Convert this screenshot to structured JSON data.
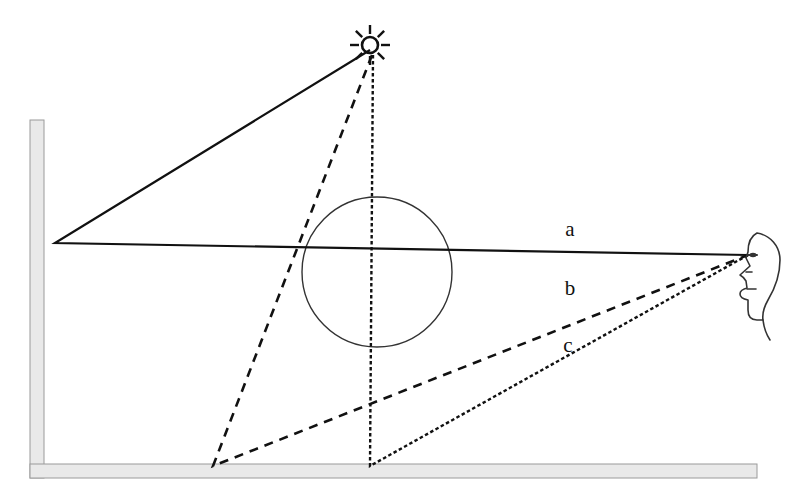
{
  "figure": {
    "background_color": "#ffffff",
    "width": 807,
    "height": 503
  },
  "colors": {
    "ink": "#1a1a1a",
    "line": "#111111",
    "surface_fill": "#e9e9e9",
    "surface_stroke": "#9a9a9a",
    "sphere_stroke": "#333333",
    "background": "#ffffff"
  },
  "labels": {
    "ray_a": "a",
    "ray_b": "b",
    "ray_c": "c"
  },
  "label_positions": {
    "ray_a": {
      "x": 570,
      "y": 236
    },
    "ray_b": {
      "x": 570,
      "y": 295
    },
    "ray_c": {
      "x": 568,
      "y": 352
    }
  },
  "objects": {
    "light_source": {
      "name": "sun",
      "icon": "sun-icon",
      "center": {
        "x": 370,
        "y": 45
      },
      "core_radius": 8,
      "ray_count": 8,
      "ray_inner": 11,
      "ray_outer": 20
    },
    "observer": {
      "name": "head-profile",
      "icon": "head-profile-icon",
      "eye_point": {
        "x": 748,
        "y": 255
      },
      "facing": "left"
    },
    "sphere": {
      "name": "transparent-sphere",
      "center": {
        "x": 377,
        "y": 272
      },
      "radius": 75,
      "filled": false
    },
    "wall": {
      "name": "vertical-wall",
      "x": 30,
      "y": 120,
      "width": 14,
      "height": 358
    },
    "floor": {
      "name": "horizontal-floor",
      "x": 30,
      "y": 464,
      "width": 727,
      "height": 14
    }
  },
  "rays": [
    {
      "id": "a",
      "label": "a",
      "style": "solid",
      "dash": "none",
      "description": "Source reflects off the wall then travels to the eye",
      "points": [
        {
          "x": 370,
          "y": 50
        },
        {
          "x": 55,
          "y": 243
        },
        {
          "x": 748,
          "y": 255
        }
      ]
    },
    {
      "id": "b",
      "label": "b",
      "style": "dashed",
      "dash": "9 7",
      "description": "Source reflects off the floor then travels to the eye",
      "points": [
        {
          "x": 372,
          "y": 55
        },
        {
          "x": 213,
          "y": 466
        },
        {
          "x": 748,
          "y": 255
        }
      ]
    },
    {
      "id": "c",
      "label": "c",
      "style": "dotted",
      "dash": "3.5 2.5",
      "description": "Source passes near the sphere, reflects off the floor then travels to the eye",
      "points": [
        {
          "x": 373,
          "y": 55
        },
        {
          "x": 370,
          "y": 466
        },
        {
          "x": 748,
          "y": 255
        }
      ]
    }
  ]
}
